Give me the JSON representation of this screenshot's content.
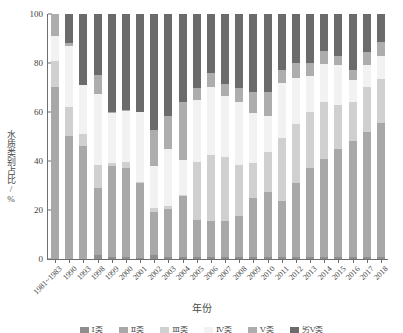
{
  "chart_data": {
    "type": "bar",
    "stacked": true,
    "title": "",
    "xlabel": "年份",
    "ylabel": "水质类别占比/%",
    "ylim": [
      0,
      100
    ],
    "yticks": [
      0,
      20,
      40,
      60,
      80,
      100
    ],
    "grid": false,
    "legend_position": "bottom",
    "categories": [
      "1981~1983",
      "1990",
      "1993",
      "1998",
      "1999",
      "2000",
      "2001",
      "2002",
      "2003",
      "2004",
      "2005",
      "2006",
      "2007",
      "2008",
      "2009",
      "2010",
      "2011",
      "2012",
      "2013",
      "2014",
      "2015",
      "2016",
      "2017",
      "2018"
    ],
    "series": [
      {
        "name": "Ⅰ类",
        "color": "#8e8e8e",
        "values": [
          0,
          0,
          0,
          1.5,
          1.0,
          1.0,
          0.5,
          1.5,
          1.0,
          1.0,
          1.0,
          1.0,
          1.0,
          1.0,
          1.0,
          1.0,
          1.0,
          1.0,
          1.0,
          1.0,
          1.0,
          1.0,
          1.0,
          1.0
        ]
      },
      {
        "name": "Ⅱ类",
        "color": "#a8a8a8",
        "values": [
          70.0,
          50.0,
          46.0,
          27.5,
          37.0,
          36.0,
          30.5,
          17.5,
          19.5,
          24.5,
          15.0,
          14.5,
          14.5,
          16.5,
          24.0,
          26.5,
          22.5,
          30.0,
          36.0,
          40.0,
          44.0,
          47.0,
          51.0,
          54.5
        ]
      },
      {
        "name": "Ⅲ类",
        "color": "#d0d0d0",
        "values": [
          11.0,
          12.0,
          5.0,
          9.5,
          1.0,
          2.5,
          0.5,
          2.0,
          1.0,
          0.5,
          23.5,
          27.0,
          26.0,
          21.0,
          14.0,
          16.0,
          26.0,
          24.0,
          23.0,
          23.0,
          18.0,
          16.0,
          18.0,
          18.0
        ]
      },
      {
        "name": "Ⅳ类",
        "color": "#f2f2f2",
        "values": [
          10.0,
          25.0,
          20.0,
          29.0,
          20.5,
          21.0,
          28.5,
          17.0,
          23.5,
          14.5,
          25.5,
          27.5,
          25.0,
          25.5,
          20.5,
          15.0,
          22.5,
          19.0,
          14.5,
          15.5,
          16.0,
          9.0,
          9.0,
          9.5
        ]
      },
      {
        "name": "Ⅴ类",
        "color": "#adadad",
        "values": [
          9.0,
          1.0,
          0.0,
          7.5,
          0.5,
          0.5,
          0.0,
          14.5,
          13.5,
          23.5,
          5.0,
          6.0,
          5.0,
          6.0,
          8.5,
          9.5,
          5.0,
          6.0,
          5.5,
          5.5,
          4.0,
          4.0,
          5.5,
          5.5
        ]
      },
      {
        "name": "劣Ⅴ类",
        "color": "#6b6b6b",
        "values": [
          0.0,
          12.0,
          29.0,
          25.0,
          40.0,
          39.0,
          40.0,
          47.5,
          41.5,
          36.0,
          30.0,
          24.0,
          28.5,
          30.0,
          32.0,
          32.0,
          23.0,
          20.0,
          20.0,
          15.0,
          17.0,
          23.0,
          15.5,
          11.5
        ]
      }
    ]
  }
}
